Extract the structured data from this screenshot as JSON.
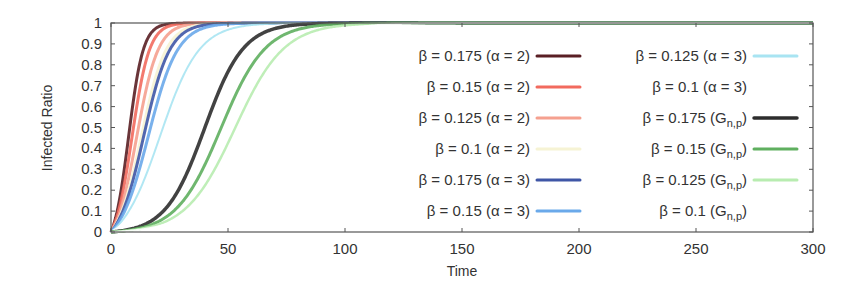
{
  "chart_data": {
    "type": "line",
    "title": "",
    "xlabel": "Time",
    "ylabel": "Infected Ratio",
    "xlim": [
      0,
      300
    ],
    "ylim": [
      0,
      1
    ],
    "xticks": [
      0,
      50,
      100,
      150,
      200,
      250,
      300
    ],
    "yticks": [
      0,
      0.1,
      0.2,
      0.3,
      0.4,
      0.5,
      0.6,
      0.7,
      0.8,
      0.9,
      1
    ],
    "ytick_labels": [
      "0",
      "0.1",
      "0.2",
      "0.3",
      "0.4",
      "0.5",
      "0.6",
      "0.7",
      "0.8",
      "0.9",
      "1"
    ],
    "grid": false,
    "legend_position": "inside-right, two columns",
    "series": [
      {
        "name": "β = 0.175 (α = 2)",
        "color": "#5a1f24",
        "width": 3,
        "midpoint": 7.5,
        "rate": 0.32,
        "x": [
          0,
          5,
          8,
          12,
          16,
          25,
          40,
          300
        ],
        "y": [
          0,
          0.3,
          0.55,
          0.8,
          0.92,
          0.98,
          1.0,
          1.0
        ]
      },
      {
        "name": "β = 0.15 (α = 2)",
        "color": "#f26a5e",
        "width": 3,
        "midpoint": 9,
        "rate": 0.27,
        "x": [
          0,
          5,
          9,
          14,
          20,
          30,
          50,
          300
        ],
        "y": [
          0,
          0.25,
          0.5,
          0.78,
          0.9,
          0.97,
          1.0,
          1.0
        ]
      },
      {
        "name": "β = 0.125 (α = 2)",
        "color": "#f5a08f",
        "width": 3,
        "midpoint": 11,
        "rate": 0.22,
        "x": [
          0,
          6,
          11,
          17,
          25,
          35,
          55,
          300
        ],
        "y": [
          0,
          0.22,
          0.5,
          0.77,
          0.9,
          0.96,
          0.99,
          1.0
        ]
      },
      {
        "name": "β = 0.1 (α = 2)",
        "color": "#f6f3d4",
        "width": 3,
        "midpoint": 13,
        "rate": 0.19,
        "x": [
          0,
          7,
          13,
          20,
          30,
          45,
          65,
          300
        ],
        "y": [
          0,
          0.22,
          0.5,
          0.76,
          0.9,
          0.97,
          0.99,
          1.0
        ]
      },
      {
        "name": "β = 0.175 (α = 3)",
        "color": "#3f56a6",
        "width": 3,
        "midpoint": 14,
        "rate": 0.18,
        "x": [
          0,
          8,
          14,
          22,
          30,
          45,
          65,
          300
        ],
        "y": [
          0,
          0.25,
          0.5,
          0.78,
          0.9,
          0.97,
          0.99,
          1.0
        ]
      },
      {
        "name": "β = 0.15 (α = 3)",
        "color": "#6aa9ea",
        "width": 3,
        "midpoint": 16,
        "rate": 0.16,
        "x": [
          0,
          9,
          16,
          25,
          35,
          50,
          70,
          300
        ],
        "y": [
          0,
          0.24,
          0.5,
          0.76,
          0.89,
          0.96,
          0.99,
          1.0
        ]
      },
      {
        "name": "β = 0.125 (α = 3)",
        "color": "#a8e4f2",
        "width": 2,
        "midpoint": 21,
        "rate": 0.12,
        "x": [
          0,
          11,
          21,
          32,
          45,
          65,
          90,
          300
        ],
        "y": [
          0,
          0.23,
          0.5,
          0.77,
          0.9,
          0.97,
          0.99,
          1.0
        ]
      },
      {
        "name": "β = 0.1 (α = 3)",
        "color": "#ffffff",
        "width": 2,
        "midpoint": 27,
        "rate": 0.1,
        "x": [
          0,
          15,
          27,
          40,
          55,
          80,
          300
        ],
        "y": [
          0,
          0.23,
          0.5,
          0.79,
          0.9,
          0.98,
          1.0
        ]
      },
      {
        "name": "β = 0.175 (Gn,p)",
        "color": "#2d2d2d",
        "width": 3.5,
        "midpoint": 40,
        "rate": 0.12,
        "x": [
          0,
          20,
          30,
          40,
          50,
          60,
          80,
          100,
          300
        ],
        "y": [
          0,
          0.08,
          0.23,
          0.5,
          0.77,
          0.9,
          0.97,
          0.99,
          1.0
        ]
      },
      {
        "name": "β = 0.15 (Gn,p)",
        "color": "#5faf5f",
        "width": 3,
        "midpoint": 47,
        "rate": 0.105,
        "x": [
          0,
          25,
          37,
          47,
          60,
          72,
          90,
          110,
          300
        ],
        "y": [
          0,
          0.09,
          0.23,
          0.5,
          0.79,
          0.9,
          0.97,
          0.99,
          1.0
        ]
      },
      {
        "name": "β = 0.125 (Gn,p)",
        "color": "#b8ecb0",
        "width": 2.5,
        "midpoint": 53,
        "rate": 0.095,
        "x": [
          0,
          28,
          42,
          53,
          66,
          80,
          100,
          120,
          300
        ],
        "y": [
          0,
          0.09,
          0.23,
          0.5,
          0.77,
          0.9,
          0.97,
          0.99,
          1.0
        ]
      },
      {
        "name": "β = 0.1 (Gn,p)",
        "color": "#ffffff",
        "width": 2,
        "midpoint": 60,
        "rate": 0.085,
        "x": [
          0,
          32,
          48,
          60,
          75,
          90,
          110,
          300
        ],
        "y": [
          0,
          0.09,
          0.24,
          0.5,
          0.78,
          0.9,
          0.97,
          1.0
        ]
      }
    ],
    "legend": {
      "columns": [
        [
          {
            "label": "β = 0.175 (α = 2)",
            "series": 0
          },
          {
            "label": "β = 0.15 (α = 2)",
            "series": 1
          },
          {
            "label": "β = 0.125 (α = 2)",
            "series": 2
          },
          {
            "label": "β = 0.1 (α = 2)",
            "series": 3
          },
          {
            "label": "β = 0.175 (α = 3)",
            "series": 4
          },
          {
            "label": "β = 0.15 (α = 3)",
            "series": 5
          }
        ],
        [
          {
            "label": "β = 0.125 (α = 3)",
            "series": 6
          },
          {
            "label": "β = 0.1 (α = 3)",
            "series": 7
          },
          {
            "label": "β = 0.175 (Gn,p)",
            "series": 8
          },
          {
            "label": "β = 0.15 (Gn,p)",
            "series": 9
          },
          {
            "label": "β = 0.125 (Gn,p)",
            "series": 10
          },
          {
            "label": "β = 0.1 (Gn,p)",
            "series": 11
          }
        ]
      ]
    }
  }
}
